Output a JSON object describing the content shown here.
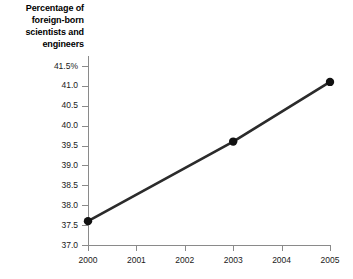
{
  "chart_data": {
    "type": "line",
    "title": "Percentage of\nforeign-born\nscientists and\nengineers",
    "title_lines": [
      "Percentage of",
      "foreign-born",
      "scientists and",
      "engineers"
    ],
    "xlabel": "",
    "ylabel": "",
    "x": [
      2000,
      2003,
      2005
    ],
    "values": [
      37.6,
      39.6,
      41.1
    ],
    "series": [
      {
        "name": "Percentage of foreign-born scientists and engineers",
        "x": [
          2000,
          2003,
          2005
        ],
        "values": [
          37.6,
          39.6,
          41.1
        ]
      }
    ],
    "xlim": [
      2000,
      2005
    ],
    "ylim": [
      37.0,
      41.5
    ],
    "x_ticks": [
      2000,
      2001,
      2002,
      2003,
      2004,
      2005
    ],
    "x_tick_labels": [
      "2000",
      "2001",
      "2002",
      "2003",
      "2004",
      "2005"
    ],
    "y_ticks": [
      37.0,
      37.5,
      38.0,
      38.5,
      39.0,
      39.5,
      40.0,
      40.5,
      41.0,
      41.5
    ],
    "y_tick_labels": [
      "37.0",
      "37.5",
      "38.0",
      "38.5",
      "39.0",
      "39.5",
      "40.0",
      "40.5",
      "41.0",
      "41.5%"
    ],
    "grid": false,
    "legend": null,
    "marker": "filled-circle",
    "line_color": "#2b2b2b",
    "marker_color": "#111111",
    "axis_color": "#8a8a8a",
    "background_color": "#ffffff",
    "text_color": "#000000"
  }
}
